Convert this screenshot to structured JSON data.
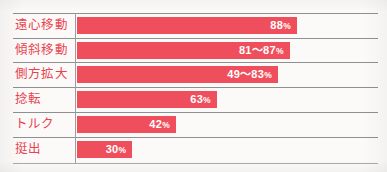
{
  "chart_data": {
    "type": "bar",
    "title": "",
    "subtitle": "",
    "xlabel": "",
    "ylabel": "",
    "orientation": "horizontal",
    "grid": false,
    "legend": null,
    "xlim": [
      0,
      100
    ],
    "unit": "%",
    "range_separator": "〜",
    "categories": [
      "遠心移動",
      "傾斜移動",
      "側方拡大",
      "捻転",
      "トルク",
      "挺出"
    ],
    "values": [
      88,
      87,
      83,
      63,
      42,
      30
    ],
    "value_labels": [
      "88%",
      "81〜87%",
      "49〜83%",
      "63%",
      "42%",
      "30%"
    ],
    "rows": [
      {
        "label": "遠心移動",
        "value": 88,
        "low": 88,
        "high": 88,
        "number": "88",
        "unit": "%",
        "bar_pct": 73.0
      },
      {
        "label": "傾斜移動",
        "value": 87,
        "low": 81,
        "high": 87,
        "number": "81〜87",
        "unit": "%",
        "bar_pct": 70.6
      },
      {
        "label": "側方拡大",
        "value": 83,
        "low": 49,
        "high": 83,
        "number": "49〜83",
        "unit": "%",
        "bar_pct": 66.7
      },
      {
        "label": "捻転",
        "value": 63,
        "low": 63,
        "high": 63,
        "number": "63",
        "unit": "%",
        "bar_pct": 46.4
      },
      {
        "label": "トルク",
        "value": 42,
        "low": 42,
        "high": 42,
        "number": "42",
        "unit": "%",
        "bar_pct": 32.8
      },
      {
        "label": "挺出",
        "value": 30,
        "low": 30,
        "high": 30,
        "number": "30",
        "unit": "%",
        "bar_pct": 18.3
      }
    ]
  },
  "colors": {
    "bar": "#ef4f5d",
    "label_text": "#e8434f",
    "value_text": "#ffffff",
    "rule": "#8d8f91",
    "axis": "#9b9d9f",
    "background": "#fbfaf8"
  }
}
